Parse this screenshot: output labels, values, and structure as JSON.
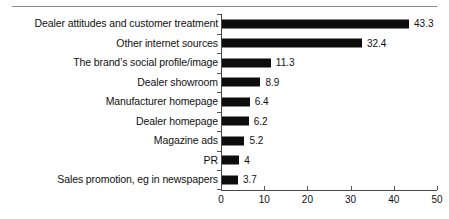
{
  "chart_data": {
    "type": "bar",
    "orientation": "horizontal",
    "title": "",
    "subtitle": "",
    "xlabel": "",
    "ylabel": "",
    "xlim": [
      0,
      50
    ],
    "grid": false,
    "legend": null,
    "categories": [
      "Dealer attitudes and customer treatment",
      "Other internet sources",
      "The brand’s social profile/image",
      "Dealer showroom",
      "Manufacturer homepage",
      "Dealer homepage",
      "Magazine ads",
      "PR",
      "Sales promotion, eg in newspapers"
    ],
    "values": [
      43.3,
      32.4,
      11.3,
      8.9,
      6.4,
      6.2,
      5.2,
      4,
      3.7
    ],
    "value_labels": [
      "43.3",
      "32.4",
      "11.3",
      "8.9",
      "6.4",
      "6.2",
      "5.2",
      "4",
      "3.7"
    ],
    "xticks": [
      0,
      10,
      20,
      30,
      40,
      50
    ],
    "xtick_labels": [
      "0",
      "10",
      "20",
      "30",
      "40",
      "50"
    ],
    "bar_color": "#0d0d0d",
    "axis_color": "#444444",
    "background_color": "#ffffff"
  }
}
